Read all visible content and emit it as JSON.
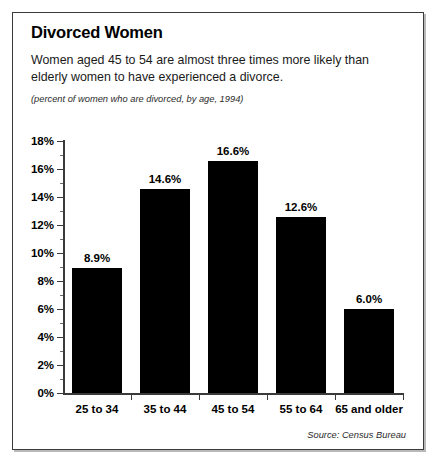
{
  "figure": {
    "title": "Divorced Women",
    "subtitle": "Women aged 45 to 54 are almost three times more likely than elderly women to have experienced a divorce.",
    "units_note": "(percent of women who are divorced, by age, 1994)",
    "source": "Source: Census Bureau",
    "bar_color": "#000000",
    "axis_color": "#3a3a3a",
    "border_color": "#3a3a3a",
    "background": "#ffffff"
  },
  "chart_data": {
    "type": "bar",
    "title": "Divorced Women",
    "subtitle": "Women aged 45 to 54 are almost three times more likely than elderly women to have experienced a divorce.",
    "units": "(percent of women who are divorced, by age, 1994)",
    "source": "Source: Census Bureau",
    "xlabel": "",
    "ylabel": "",
    "categories": [
      "25 to 34",
      "35 to 44",
      "45 to 54",
      "55 to 64",
      "65 and older"
    ],
    "values": [
      8.9,
      14.6,
      16.6,
      12.6,
      6.0
    ],
    "value_labels": [
      "8.9%",
      "14.6%",
      "16.6%",
      "12.6%",
      "6.0%"
    ],
    "ylim": [
      0,
      18
    ],
    "ytick_values": [
      0,
      2,
      4,
      6,
      8,
      10,
      12,
      14,
      16,
      18
    ],
    "ytick_labels": [
      "0%",
      "2%",
      "4%",
      "6%",
      "8%",
      "10%",
      "12%",
      "14%",
      "16%",
      "18%"
    ],
    "yminor_values": [
      1,
      3,
      5,
      7,
      9,
      11,
      13,
      15,
      17
    ],
    "grid": false,
    "legend": false,
    "series": [
      {
        "name": "percent divorced",
        "values": [
          8.9,
          14.6,
          16.6,
          12.6,
          6.0
        ]
      }
    ]
  }
}
